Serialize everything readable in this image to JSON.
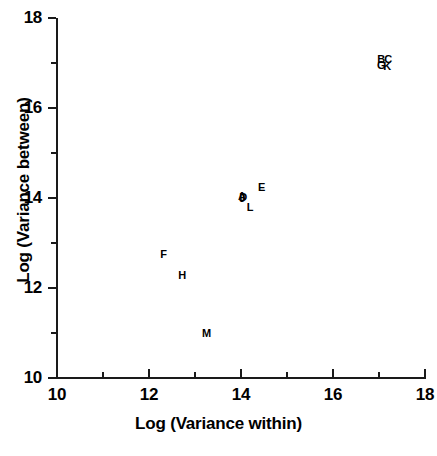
{
  "chart_data": {
    "type": "scatter",
    "title": "",
    "xlabel": "Log (Variance within)",
    "ylabel": "Log (Variance between)",
    "xlim": [
      10,
      18
    ],
    "ylim": [
      10,
      18
    ],
    "xticks": [
      10,
      12,
      14,
      16,
      18
    ],
    "yticks": [
      10,
      12,
      14,
      16,
      18
    ],
    "xtick_labels": [
      "10",
      "12",
      "14",
      "16",
      "18"
    ],
    "ytick_labels": [
      "10",
      "12",
      "14",
      "16",
      "18"
    ],
    "xminorticks": [
      11,
      13,
      15,
      17
    ],
    "yminorticks": [
      11,
      13,
      15,
      17
    ],
    "grid": false,
    "legend": "none",
    "marker_style": "letter-label",
    "points": [
      {
        "label": "B",
        "x": 17.05,
        "y": 17.1
      },
      {
        "label": "C",
        "x": 17.2,
        "y": 17.08
      },
      {
        "label": "G",
        "x": 17.05,
        "y": 16.95
      },
      {
        "label": "K",
        "x": 17.18,
        "y": 16.93
      },
      {
        "label": "E",
        "x": 14.45,
        "y": 14.25
      },
      {
        "label": "A",
        "x": 14.02,
        "y": 14.05
      },
      {
        "label": "D",
        "x": 14.05,
        "y": 14.03
      },
      {
        "label": "J",
        "x": 14.03,
        "y": 14.0
      },
      {
        "label": "L",
        "x": 14.2,
        "y": 13.8
      },
      {
        "label": "F",
        "x": 12.32,
        "y": 12.75
      },
      {
        "label": "H",
        "x": 12.72,
        "y": 12.3
      },
      {
        "label": "M",
        "x": 13.25,
        "y": 11.0
      }
    ]
  },
  "axes": {
    "x_title": "Log (Variance within)",
    "y_title": "Log (Variance between)"
  },
  "caption": {
    "text": ""
  }
}
